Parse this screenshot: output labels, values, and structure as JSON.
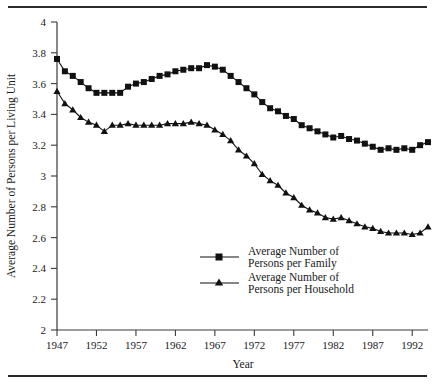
{
  "chart_data": {
    "type": "line",
    "title": "",
    "subtitle": "",
    "xlabel": "Year",
    "ylabel": "Average Number of Persons per Living Unit",
    "xlim": [
      1947,
      1994
    ],
    "ylim": [
      2,
      4
    ],
    "ytick_step": 0.2,
    "yticks": [
      "2",
      "2.2",
      "2.4",
      "2.6",
      "2.8",
      "3",
      "3.2",
      "3.4",
      "3.6",
      "3.8",
      "4"
    ],
    "xticks": [
      "1947",
      "1952",
      "1957",
      "1962",
      "1967",
      "1972",
      "1977",
      "1982",
      "1987",
      "1992"
    ],
    "grid": false,
    "legend_position": "center-bottom-inside",
    "x": [
      1947,
      1948,
      1949,
      1950,
      1951,
      1952,
      1953,
      1954,
      1955,
      1956,
      1957,
      1958,
      1959,
      1960,
      1961,
      1962,
      1963,
      1964,
      1965,
      1966,
      1967,
      1968,
      1969,
      1970,
      1971,
      1972,
      1973,
      1974,
      1975,
      1976,
      1977,
      1978,
      1979,
      1980,
      1981,
      1982,
      1983,
      1984,
      1985,
      1986,
      1987,
      1988,
      1989,
      1990,
      1991,
      1992,
      1993,
      1994
    ],
    "series": [
      {
        "name": "Average Number of Persons per Family",
        "marker": "square",
        "color": "#111111",
        "values": [
          3.76,
          3.68,
          3.65,
          3.61,
          3.57,
          3.54,
          3.54,
          3.54,
          3.54,
          3.58,
          3.6,
          3.61,
          3.63,
          3.65,
          3.66,
          3.68,
          3.69,
          3.7,
          3.7,
          3.72,
          3.71,
          3.69,
          3.65,
          3.61,
          3.57,
          3.53,
          3.48,
          3.44,
          3.42,
          3.39,
          3.37,
          3.33,
          3.31,
          3.29,
          3.27,
          3.25,
          3.26,
          3.24,
          3.23,
          3.21,
          3.19,
          3.17,
          3.18,
          3.17,
          3.18,
          3.17,
          3.2,
          3.22
        ]
      },
      {
        "name": "Average Number of Persons per Household",
        "marker": "triangle",
        "color": "#111111",
        "values": [
          3.55,
          3.47,
          3.43,
          3.38,
          3.35,
          3.33,
          3.29,
          3.33,
          3.33,
          3.34,
          3.33,
          3.33,
          3.33,
          3.33,
          3.34,
          3.34,
          3.34,
          3.35,
          3.34,
          3.33,
          3.3,
          3.27,
          3.23,
          3.17,
          3.13,
          3.08,
          3.01,
          2.97,
          2.94,
          2.89,
          2.86,
          2.81,
          2.78,
          2.76,
          2.73,
          2.72,
          2.73,
          2.71,
          2.69,
          2.67,
          2.66,
          2.64,
          2.63,
          2.63,
          2.63,
          2.62,
          2.63,
          2.67
        ]
      }
    ]
  },
  "legend": {
    "entries": [
      {
        "line1": "Average Number of",
        "line2": "Persons per Family"
      },
      {
        "line1": "Average Number of",
        "line2": "Persons per Household"
      }
    ]
  }
}
